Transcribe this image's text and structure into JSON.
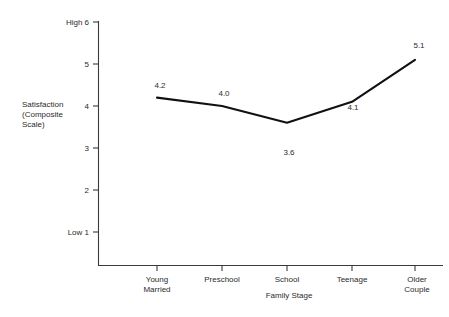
{
  "chart_data": {
    "type": "line",
    "title": "",
    "xlabel": "Family Stage",
    "ylabel": "Satisfaction (Composite Scale)",
    "ylabel_lines": [
      "Satisfaction",
      "(Composite",
      "Scale)"
    ],
    "categories": [
      "Young Married",
      "Preschool",
      "School",
      "Teenage",
      "Older Couple"
    ],
    "category_lines": [
      [
        "Young",
        "Married"
      ],
      [
        "Preschool"
      ],
      [
        "School"
      ],
      [
        "Teenage"
      ],
      [
        "Older",
        "Couple"
      ]
    ],
    "values": [
      4.2,
      4.0,
      3.6,
      4.1,
      5.1
    ],
    "value_labels": [
      "4.2",
      "4.0",
      "3.6",
      "4.1",
      "5.1"
    ],
    "ylim": [
      1,
      6
    ],
    "yticks": [
      1,
      2,
      3,
      4,
      5,
      6
    ],
    "ytick_labels": [
      "Low 1",
      "2",
      "3",
      "4",
      "5",
      "High 6"
    ],
    "grid": false,
    "legend": null,
    "line_color": "#111111",
    "axis_color": "#3a3a3a",
    "background": "#ffffff"
  }
}
